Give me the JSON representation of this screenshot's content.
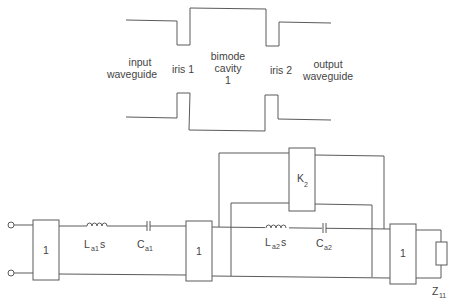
{
  "waveguide": {
    "input_label_line1": "input",
    "input_label_line2": "waveguide",
    "iris1_label": "iris 1",
    "cavity_label_line1": "bimode",
    "cavity_label_line2": "cavity",
    "cavity_label_line3": "1",
    "iris2_label": "iris 2",
    "output_label_line1": "output",
    "output_label_line2": "waveguide"
  },
  "circuit": {
    "inverter1_label": "1",
    "inverter2_label": "1",
    "inverter3_label": "1",
    "coupling_label": "K",
    "coupling_sub": "2",
    "inductor1_label": "L",
    "inductor1_sub": "a1",
    "inductor1_suffix": "s",
    "capacitor1_label": "C",
    "capacitor1_sub": "a1",
    "inductor2_label": "L",
    "inductor2_sub": "a2",
    "inductor2_suffix": "s",
    "capacitor2_label": "C",
    "capacitor2_sub": "a2",
    "load_label": "Z",
    "load_sub": "11"
  }
}
